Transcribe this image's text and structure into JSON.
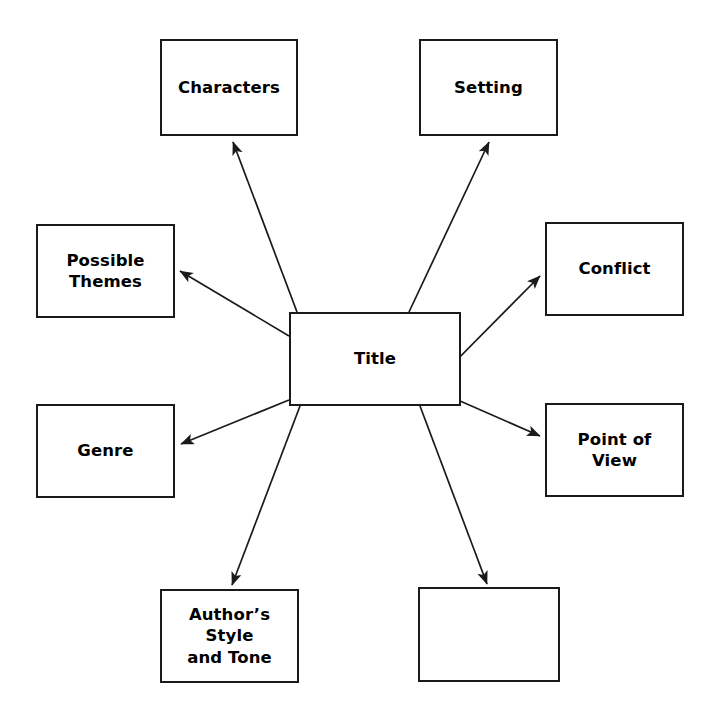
{
  "diagram": {
    "type": "story-map-web-diagram",
    "title_node": {
      "label": "Title",
      "x": 289,
      "y": 312,
      "w": 172,
      "h": 94
    },
    "canvas": {
      "width": 719,
      "height": 728,
      "background": "#ffffff",
      "stroke": "#1a1a1a",
      "text_color": "#000000"
    },
    "nodes": [
      {
        "id": "characters",
        "label": "Characters",
        "x": 160,
        "y": 39,
        "w": 138,
        "h": 97
      },
      {
        "id": "setting",
        "label": "Setting",
        "x": 419,
        "y": 39,
        "w": 139,
        "h": 97
      },
      {
        "id": "possible-themes",
        "label": "Possible\nThemes",
        "x": 36,
        "y": 224,
        "w": 139,
        "h": 94
      },
      {
        "id": "conflict",
        "label": "Conflict",
        "x": 545,
        "y": 222,
        "w": 139,
        "h": 94
      },
      {
        "id": "genre",
        "label": "Genre",
        "x": 36,
        "y": 404,
        "w": 139,
        "h": 94
      },
      {
        "id": "point-of-view",
        "label": "Point of View",
        "x": 545,
        "y": 403,
        "w": 139,
        "h": 94
      },
      {
        "id": "authors-style",
        "label": "Author’s Style\nand Tone",
        "x": 160,
        "y": 589,
        "w": 139,
        "h": 94
      },
      {
        "id": "blank-node",
        "label": "",
        "x": 418,
        "y": 587,
        "w": 142,
        "h": 95
      }
    ],
    "connectors": [
      {
        "id": "title-to-characters",
        "from": "title",
        "to": "characters",
        "x1": 297,
        "y1": 312,
        "x2": 233,
        "y2": 142
      },
      {
        "id": "title-to-setting",
        "from": "title",
        "to": "setting",
        "x2": 489,
        "y2": 142,
        "x1": 409,
        "y1": 312
      },
      {
        "id": "title-to-possible-themes",
        "from": "title",
        "to": "possible-themes",
        "x1": 289,
        "y1": 336,
        "x2": 180,
        "y2": 271
      },
      {
        "id": "title-to-conflict",
        "from": "title",
        "to": "conflict",
        "x1": 435,
        "y1": 382,
        "x2": 540,
        "y2": 276
      },
      {
        "id": "title-to-genre",
        "from": "title",
        "to": "genre",
        "x1": 289,
        "y1": 400,
        "x2": 181,
        "y2": 444
      },
      {
        "id": "title-to-point-of-view",
        "from": "title",
        "to": "point-of-view",
        "x1": 435,
        "y1": 390,
        "x2": 540,
        "y2": 436
      },
      {
        "id": "title-to-authors-style",
        "from": "title",
        "to": "authors-style",
        "x1": 300,
        "y1": 406,
        "x2": 232,
        "y2": 585
      },
      {
        "id": "title-to-blank-node",
        "from": "title",
        "to": "blank-node",
        "x1": 420,
        "y1": 406,
        "x2": 487,
        "y2": 584
      }
    ]
  }
}
